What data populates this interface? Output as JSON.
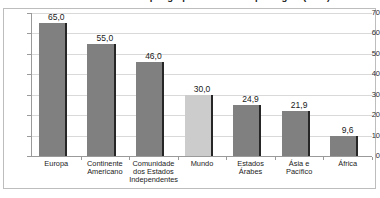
{
  "figure": {
    "title": "Número de benefícios por grupo de receitas e por região (2010)",
    "title_clipped": true
  },
  "colors": {
    "bar_default": "#808080",
    "bar_highlight": "#cccccc",
    "bar_edge": "#262626",
    "gridline": "#d9d9d9",
    "axis": "#9a9a9a",
    "frame": "#bdbdbd",
    "text": "#1a1a1a",
    "background": "#ffffff"
  },
  "chart_data": {
    "type": "bar",
    "title": "Número de benefícios por grupo de receitas e por região (2010)",
    "xlabel": "",
    "ylabel": "",
    "categories": [
      "Europa",
      "Continente Americano",
      "Comunidade dos Estados Independentes",
      "Mundo",
      "Estados Árabes",
      "Ásia e Pacífico",
      "África"
    ],
    "values": [
      65.0,
      55.0,
      46.0,
      30.0,
      24.9,
      21.9,
      9.6
    ],
    "value_labels": [
      "65,0",
      "55,0",
      "46,0",
      "30,0",
      "24,9",
      "21,9",
      "9,6"
    ],
    "highlighted_categories": [
      "Mundo"
    ],
    "ylim": [
      0,
      70
    ],
    "yticks": [
      0,
      10,
      20,
      30,
      40,
      50,
      60,
      70
    ],
    "ytick_labels": [
      "0",
      "10",
      "20",
      "30",
      "40",
      "50",
      "60",
      "70"
    ],
    "grid": true,
    "grid_axis": "y",
    "legend": false,
    "decimal_separator": ","
  }
}
